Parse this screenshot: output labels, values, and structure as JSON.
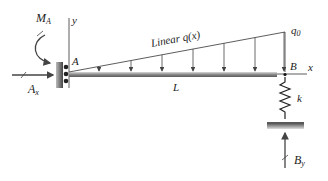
{
  "diagram": {
    "labels": {
      "moment_A": "M",
      "moment_A_sub": "A",
      "y_axis": "y",
      "point_A": "A",
      "force_Ax": "A",
      "force_Ax_sub": "x",
      "load_label": "Linear q(x)",
      "q0": "q",
      "q0_sub": "0",
      "point_B": "B",
      "x_axis": "x",
      "length": "L",
      "spring": "k",
      "force_By": "B",
      "force_By_sub": "y"
    },
    "colors": {
      "beam": "#9a9a9a",
      "lines": "#333333",
      "support": "#555555"
    }
  }
}
